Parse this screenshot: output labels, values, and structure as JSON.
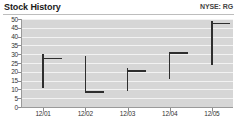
{
  "header": {
    "title": "Stock History",
    "ticker": "NYSE: RG"
  },
  "colors": {
    "plot_background": "#d6d6d6",
    "gridline": "#f2f2f2",
    "bar": "#2e2e2e",
    "axis": "#9a9a9a",
    "text": "#333333",
    "title_text": "#1a1a1a",
    "page_background": "#ffffff"
  },
  "chart_data": {
    "type": "bar",
    "subtype": "ohlc-hlc-price-bars",
    "title": "Stock History",
    "subtitle": "NYSE: RG",
    "xlabel": "",
    "ylabel": "",
    "ylim": [
      0,
      50
    ],
    "ytick_step": 5,
    "grid": true,
    "legend": false,
    "categories": [
      "12/01",
      "12/02",
      "12/03",
      "12/04",
      "12/05"
    ],
    "ytick_labels": [
      "50",
      "45",
      "40",
      "35",
      "30",
      "25",
      "20",
      "15",
      "10",
      "5",
      "0"
    ],
    "ytick_values": [
      50,
      45,
      40,
      35,
      30,
      25,
      20,
      15,
      10,
      5,
      0
    ],
    "bars": [
      {
        "date": "12/01",
        "high": 30,
        "low": 11,
        "close": 28,
        "open": 30
      },
      {
        "date": "12/02",
        "high": 29,
        "low": 8,
        "close": 9,
        "open": 29
      },
      {
        "date": "12/03",
        "high": 22,
        "low": 9,
        "close": 21,
        "open": 22
      },
      {
        "date": "12/04",
        "high": 31,
        "low": 16,
        "close": 31,
        "open": 31
      },
      {
        "date": "12/05",
        "high": 49,
        "low": 24,
        "close": 48,
        "open": 49
      }
    ],
    "series": [
      {
        "name": "High",
        "values": [
          30,
          29,
          22,
          31,
          49
        ]
      },
      {
        "name": "Low",
        "values": [
          11,
          8,
          9,
          16,
          24
        ]
      },
      {
        "name": "Close",
        "values": [
          28,
          9,
          21,
          31,
          48
        ]
      }
    ]
  }
}
